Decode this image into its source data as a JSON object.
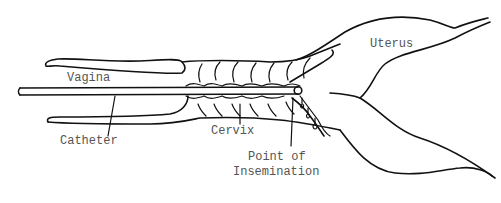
{
  "diagram": {
    "labels": {
      "vagina": "Vagina",
      "uterus": "Uterus",
      "catheter": "Catheter",
      "cervix": "Cervix",
      "point_line1": "Point of",
      "point_line2": "Insemination"
    },
    "colors": {
      "line": "#111111",
      "text": "#555555",
      "background": "#ffffff"
    }
  }
}
